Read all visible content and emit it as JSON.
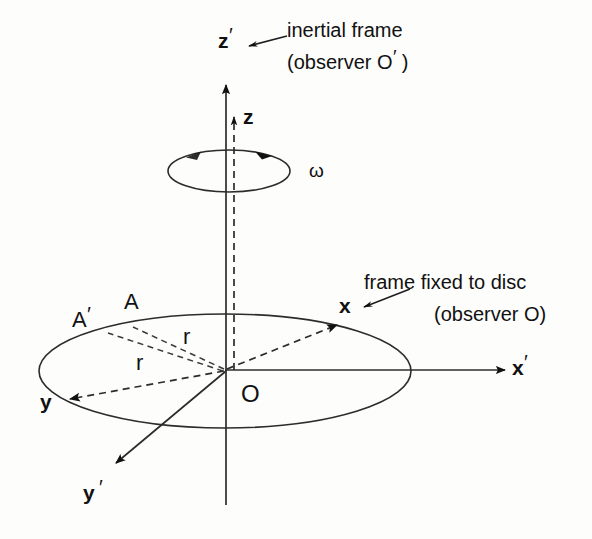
{
  "figure": {
    "kind": "physics-vector-diagram",
    "background_color": "#fdfdfc",
    "ink_color": "#111111"
  },
  "labels": {
    "z_prime_axis": "z",
    "z_axis": "z",
    "x_prime_axis": "x",
    "x_axis": "x",
    "y_prime_axis": "y",
    "y_axis": "y",
    "origin": "O",
    "point_a": "A",
    "point_a_prime": "A",
    "radius_upper": "r",
    "radius_lower": "r",
    "omega": "ω",
    "prime_mark": "′"
  },
  "annotations": {
    "inertial_frame_line1": "inertial frame",
    "inertial_frame_line2_pre": "(observer O",
    "inertial_frame_line2_post": " )",
    "disc_frame_line1": "frame fixed to disc",
    "disc_frame_line2": "(observer O)"
  },
  "geometry": {
    "origin": {
      "x": 225,
      "y": 370
    },
    "disc_ellipse": {
      "cx": 225,
      "cy": 371,
      "rx": 186,
      "ry": 57
    },
    "rotation_ellipse": {
      "cx": 229,
      "cy": 171,
      "rx": 61,
      "ry": 21
    },
    "z_prime_axis": {
      "x": 226,
      "y_top": 85,
      "y_bottom": 505
    },
    "z_axis_dashed": {
      "x": 234,
      "y_top": 117,
      "y_bottom": 370
    },
    "x_prime_axis": {
      "x_start": 225,
      "x_end": 505,
      "y": 370
    },
    "x_axis_dashed": {
      "x_end": 337,
      "y_end": 325
    },
    "y_axis_dashed": {
      "x_end": 70,
      "y_end": 399
    },
    "y_prime_axis": {
      "x_end": 116,
      "y_end": 463
    },
    "ray_to_A": {
      "x_end": 133,
      "y_end": 327
    },
    "ray_to_A_prime": {
      "x_end": 108,
      "y_end": 333
    }
  }
}
